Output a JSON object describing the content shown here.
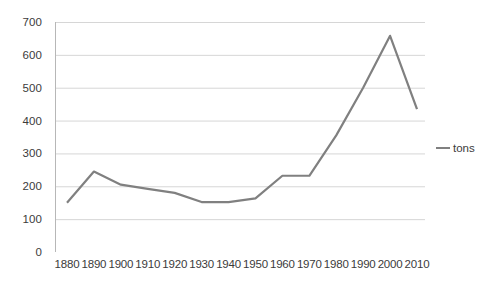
{
  "chart_data": {
    "type": "line",
    "title": "",
    "xlabel": "",
    "ylabel": "",
    "categories": [
      "1880",
      "1890",
      "1900",
      "1910",
      "1920",
      "1930",
      "1940",
      "1950",
      "1960",
      "1970",
      "1980",
      "1990",
      "2000",
      "2010"
    ],
    "series": [
      {
        "name": "tons",
        "color": "#808080",
        "values": [
          150,
          245,
          205,
          192,
          180,
          152,
          152,
          163,
          232,
          232,
          355,
          500,
          658,
          435
        ]
      }
    ],
    "ylim": [
      0,
      700
    ],
    "ytick_step": 100,
    "yticks": [
      "700",
      "600",
      "500",
      "400",
      "300",
      "200",
      "100",
      "0"
    ],
    "grid": "horizontal",
    "legend_position": "right",
    "legend_entries": [
      "tons"
    ]
  },
  "legend": {
    "series_label": "tons",
    "marker_name": "line-swatch"
  },
  "axes": {
    "y_axis_name": "value-axis",
    "x_axis_name": "year-axis"
  }
}
